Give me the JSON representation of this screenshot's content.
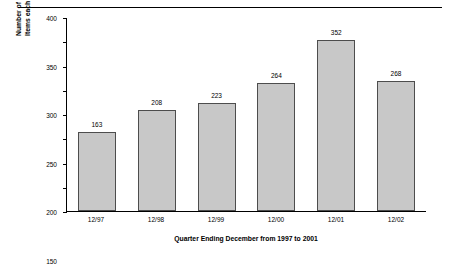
{
  "chart_data": {
    "type": "bar",
    "title": "",
    "subtitle": "",
    "xlabel": "Quarter Ending December from 1997 to 2001",
    "ylabel": "Number of  companies reporting Non-Recurring\nItems each Quarter",
    "categories": [
      "12/97",
      "12/98",
      "12/99",
      "12/00",
      "12/01",
      "12/02"
    ],
    "values": [
      163,
      208,
      223,
      264,
      352,
      268
    ],
    "data_labels": [
      "163",
      "208",
      "223",
      "264",
      "352",
      "268"
    ],
    "ylim": [
      0,
      400
    ],
    "yticks": [
      0,
      50,
      100,
      150,
      200,
      250,
      300,
      350,
      400
    ],
    "ytick_labels": [
      "0",
      "50",
      "100",
      "150",
      "200",
      "250",
      "300",
      "350",
      "400"
    ],
    "grid": false,
    "legend": null,
    "legend_position": "none",
    "bar_fill_color": "#c8c8c8",
    "bar_edge_color": "#4d4d4d",
    "axis_color": "#000000"
  }
}
